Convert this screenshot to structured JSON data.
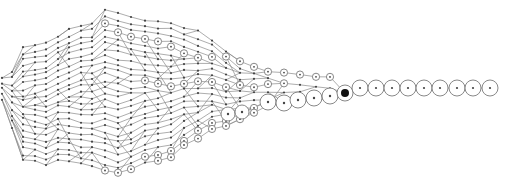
{
  "diagram": {
    "type": "converging-lineage-graph",
    "width": 521,
    "height": 183,
    "colors": {
      "edge": "#8a8a8a",
      "ring": "#7a7a7a",
      "dot": "#444444",
      "hub": "#111111",
      "background": "#ffffff"
    },
    "columns": [
      {
        "x": 2,
        "top": 78,
        "bottom": 100,
        "count": 5,
        "ring_rows": []
      },
      {
        "x": 12,
        "top": 72,
        "bottom": 128,
        "count": 10,
        "ring_rows": []
      },
      {
        "x": 23,
        "top": 48,
        "bottom": 160,
        "count": 20,
        "ring_rows": []
      },
      {
        "x": 35,
        "top": 46,
        "bottom": 162,
        "count": 21,
        "ring_rows": []
      },
      {
        "x": 46,
        "top": 44,
        "bottom": 164,
        "count": 22,
        "ring_rows": []
      },
      {
        "x": 58,
        "top": 36,
        "bottom": 160,
        "count": 22,
        "ring_rows": []
      },
      {
        "x": 69,
        "top": 30,
        "bottom": 162,
        "count": 23,
        "ring_rows": []
      },
      {
        "x": 81,
        "top": 26,
        "bottom": 164,
        "count": 24,
        "ring_rows": []
      },
      {
        "x": 92,
        "top": 24,
        "bottom": 165,
        "count": 24,
        "ring_rows": []
      },
      {
        "x": 105,
        "top": 10,
        "bottom": 170,
        "count": 26,
        "ring_rows": [
          2,
          25
        ]
      },
      {
        "x": 118,
        "top": 14,
        "bottom": 174,
        "count": 26,
        "ring_rows": [
          3,
          25
        ]
      },
      {
        "x": 131,
        "top": 18,
        "bottom": 170,
        "count": 25,
        "ring_rows": [
          3,
          24
        ]
      },
      {
        "x": 145,
        "top": 20,
        "bottom": 162,
        "count": 24,
        "ring_rows": [
          3,
          10,
          22
        ]
      },
      {
        "x": 158,
        "top": 22,
        "bottom": 160,
        "count": 23,
        "ring_rows": [
          3,
          10,
          21,
          22
        ]
      },
      {
        "x": 171,
        "top": 22,
        "bottom": 158,
        "count": 22,
        "ring_rows": [
          4,
          10,
          20,
          21
        ]
      },
      {
        "x": 184,
        "top": 28,
        "bottom": 146,
        "count": 20,
        "ring_rows": [
          4,
          9,
          18,
          19
        ]
      },
      {
        "x": 198,
        "top": 32,
        "bottom": 138,
        "count": 18,
        "ring_rows": [
          4,
          8,
          16,
          17
        ]
      },
      {
        "x": 212,
        "top": 40,
        "bottom": 130,
        "count": 16,
        "ring_rows": [
          3,
          7,
          14,
          15
        ]
      },
      {
        "x": 226,
        "top": 52,
        "bottom": 126,
        "count": 14,
        "ring_rows": [
          1,
          6,
          12,
          13
        ]
      },
      {
        "x": 240,
        "top": 62,
        "bottom": 120,
        "count": 11,
        "ring_rows": [
          0,
          4,
          9,
          10
        ]
      },
      {
        "x": 254,
        "top": 66,
        "bottom": 114,
        "count": 8,
        "ring_rows": [
          0,
          3,
          6,
          7
        ]
      },
      {
        "x": 268,
        "top": 72,
        "bottom": 106,
        "count": 6,
        "ring_rows": [
          0,
          2,
          5
        ]
      },
      {
        "x": 284,
        "top": 74,
        "bottom": 102,
        "count": 4,
        "ring_rows": [
          0,
          1,
          3
        ]
      },
      {
        "x": 300,
        "top": 76,
        "bottom": 100,
        "count": 4,
        "ring_rows": [
          0,
          3
        ]
      },
      {
        "x": 316,
        "top": 76,
        "bottom": 100,
        "count": 3,
        "ring_rows": [
          0,
          2
        ]
      },
      {
        "x": 330,
        "top": 76,
        "bottom": 98,
        "count": 3,
        "ring_rows": [
          0,
          2
        ]
      }
    ],
    "large_nodes": [
      {
        "x": 228,
        "y": 114,
        "r": 7
      },
      {
        "x": 242,
        "y": 112,
        "r": 7
      },
      {
        "x": 268,
        "y": 102,
        "r": 8
      },
      {
        "x": 284,
        "y": 103,
        "r": 8
      },
      {
        "x": 298,
        "y": 100,
        "r": 8
      },
      {
        "x": 314,
        "y": 98,
        "r": 8
      },
      {
        "x": 330,
        "y": 96,
        "r": 8
      }
    ],
    "hub": {
      "x": 345,
      "y": 93,
      "r": 8,
      "core_r": 4
    },
    "chain": {
      "y": 88,
      "r": 8,
      "xs": [
        360,
        376,
        392,
        408,
        424,
        440,
        457,
        473,
        490
      ]
    }
  }
}
